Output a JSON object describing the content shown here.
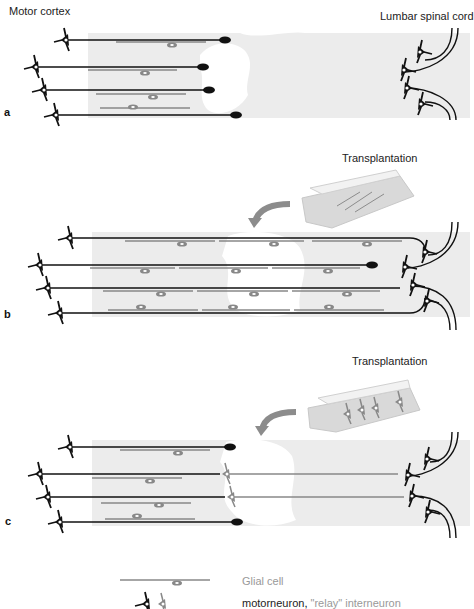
{
  "labels": {
    "motor_cortex": "Motor cortex",
    "lumbar_spinal_cord": "Lumbar spinal cord",
    "transplantation_b": "Transplantation",
    "transplantation_c": "Transplantation"
  },
  "panels": [
    {
      "letter": "a",
      "description": "Injured spinal cord: corticospinal axons end in retraction bulbs at lesion cavity"
    },
    {
      "letter": "b",
      "description": "Transplantation of glial cells bridges lesion; axons regenerate to lumbar motor neurons"
    },
    {
      "letter": "c",
      "description": "Transplantation of relay interneurons forming a relay circuit across lesion"
    }
  ],
  "legend": {
    "glial_cell": "Glial cell",
    "motorneuron": "motorneuron",
    "relay_interneuron": "\"relay\" interneuron"
  },
  "colors": {
    "tissue": "#ececec",
    "axon": "#111111",
    "glia": "#8a8a8a",
    "relay": "#8a8a8a",
    "arrow": "#8c8c8c",
    "legend_gray": "#999999"
  }
}
